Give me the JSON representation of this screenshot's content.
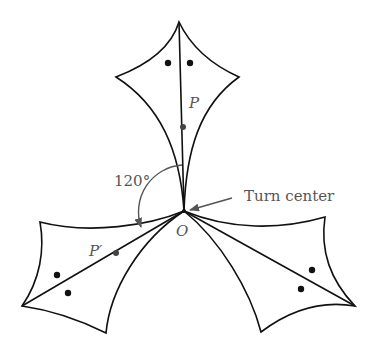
{
  "diagram": {
    "labels": {
      "point": "P",
      "image_point": "P′",
      "center": "O",
      "angle": "120°",
      "turn_center": "Turn center"
    },
    "colors": {
      "stroke": "#111111",
      "arrow": "#555555",
      "text": "#555555",
      "background": "#ffffff"
    },
    "shapes": [
      {
        "name": "original-figure",
        "orientation": "up"
      },
      {
        "name": "rotated-figure-120",
        "orientation": "lower-left"
      },
      {
        "name": "rotated-figure-240",
        "orientation": "lower-right"
      }
    ],
    "angle_degrees": 120
  }
}
